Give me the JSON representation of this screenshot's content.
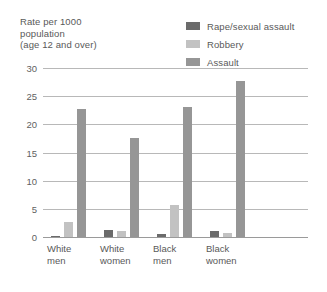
{
  "axis_title": {
    "line1": "Rate per 1000",
    "line2": "population",
    "line3": "(age 12 and over)"
  },
  "colors": {
    "rape": "#6b6b6b",
    "robbery": "#c2c2c2",
    "assault": "#969696",
    "gridline": "#b8b8b8",
    "axis": "#9a9a9a",
    "text": "#595959",
    "background": "#ffffff"
  },
  "legend": {
    "position": "top-right",
    "items": [
      {
        "label": "Rape/sexual assault",
        "color": "#6b6b6b"
      },
      {
        "label": "Robbery",
        "color": "#c2c2c2"
      },
      {
        "label": "Assault",
        "color": "#969696"
      }
    ]
  },
  "chart_data": {
    "type": "bar",
    "title": "Rate per 1000 population (age 12 and over)",
    "xlabel": "",
    "ylabel": "Rate per 1000 population (age 12 and over)",
    "ylim": [
      0,
      30
    ],
    "yticks": [
      0,
      5,
      10,
      15,
      20,
      25,
      30
    ],
    "ytick_labels": [
      "0",
      "5",
      "10",
      "15",
      "20",
      "25",
      "30"
    ],
    "grid": true,
    "legend_position": "top-right",
    "categories": [
      "White men",
      "White women",
      "Black men",
      "Black women"
    ],
    "category_lines": [
      [
        "White",
        "men"
      ],
      [
        "White",
        "women"
      ],
      [
        "Black",
        "men"
      ],
      [
        "Black",
        "women"
      ]
    ],
    "series": [
      {
        "name": "Rape/sexual assault",
        "color": "#6b6b6b",
        "values": [
          0.2,
          1.2,
          0.5,
          1.1
        ]
      },
      {
        "name": "Robbery",
        "color": "#c2c2c2",
        "values": [
          2.7,
          1.1,
          5.6,
          0.7
        ]
      },
      {
        "name": "Assault",
        "color": "#969696",
        "values": [
          22.8,
          17.6,
          23.1,
          27.7
        ]
      }
    ]
  }
}
